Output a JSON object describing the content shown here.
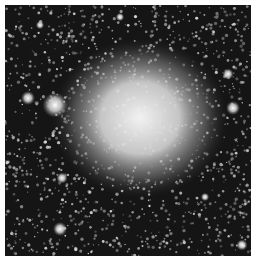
{
  "image": {
    "subject": "globular star cluster",
    "style": "grayscale astronomical photograph",
    "background_color": "#151515",
    "border_color": "#ffffff",
    "core": {
      "cx": 140,
      "cy": 118,
      "rx": 55,
      "ry": 50
    },
    "bright_objects": [
      {
        "cx": 55,
        "cy": 105,
        "r": 9
      },
      {
        "cx": 28,
        "cy": 98,
        "r": 5
      },
      {
        "cx": 60,
        "cy": 229,
        "r": 5
      },
      {
        "cx": 62,
        "cy": 178,
        "r": 4
      },
      {
        "cx": 233,
        "cy": 108,
        "r": 5
      },
      {
        "cx": 228,
        "cy": 74,
        "r": 4
      },
      {
        "cx": 242,
        "cy": 245,
        "r": 4
      },
      {
        "cx": 40,
        "cy": 25,
        "r": 3
      },
      {
        "cx": 120,
        "cy": 17,
        "r": 3
      },
      {
        "cx": 205,
        "cy": 197,
        "r": 3
      }
    ]
  }
}
